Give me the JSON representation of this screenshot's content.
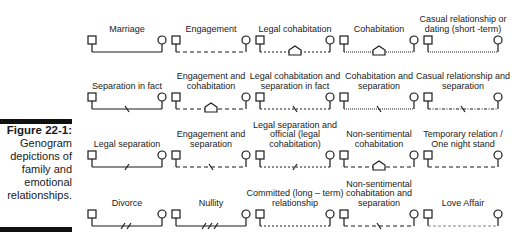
{
  "caption": {
    "title": "Figure 22-1:",
    "body": "Genogram depictions of family and emotional relationships."
  },
  "relationships": [
    {
      "label": "Marriage",
      "line": "solid",
      "marker": "none"
    },
    {
      "label": "Engagement",
      "line": "dashed",
      "marker": "none"
    },
    {
      "label": "Legal cohabitation",
      "line": "short-dashed",
      "marker": "house"
    },
    {
      "label": "Cohabitation",
      "line": "dotted",
      "marker": "house"
    },
    {
      "label": "Casual relationship or dating (short -term)",
      "line": "dotted",
      "marker": "none"
    },
    {
      "label": "Separation in fact",
      "line": "solid",
      "marker": "slash-1"
    },
    {
      "label": "Engagement and cohabitation",
      "line": "dashed",
      "marker": "house"
    },
    {
      "label": "Legal cohabitation and separation in fact",
      "line": "short-dashed",
      "marker": "slash-1"
    },
    {
      "label": "Cohabitation and separation",
      "line": "dotted",
      "marker": "slash-1"
    },
    {
      "label": "Casual relationship and separation",
      "line": "dash-dot",
      "marker": "slash-1"
    },
    {
      "label": "Legal separation",
      "line": "solid",
      "marker": "fwd-slash-1"
    },
    {
      "label": "Engagement and separation",
      "line": "dashed",
      "marker": "slash-1"
    },
    {
      "label": "Legal separation and official (legal cohabitation)",
      "line": "short-dashed",
      "marker": "fwd-slash-1"
    },
    {
      "label": "Non-sentimental cohabitation",
      "line": "dashed",
      "marker": "house"
    },
    {
      "label": "Temporary relation / One night stand",
      "line": "dashed",
      "marker": "none"
    },
    {
      "label": "Divorce",
      "line": "solid",
      "marker": "fwd-slash-2"
    },
    {
      "label": "Nullity",
      "line": "solid",
      "marker": "fwd-slash-3"
    },
    {
      "label": "Committed (long – term) relationship",
      "line": "short-dashed",
      "marker": "none"
    },
    {
      "label": "Non-sentimental cohabitation and separation",
      "line": "dashed",
      "marker": "slash-1"
    },
    {
      "label": "Love Affair",
      "line": "light-dashed",
      "marker": "none"
    }
  ],
  "legend_symbols": {
    "male": "square",
    "female": "circle"
  },
  "colors": {
    "ink": "#1a1a1a",
    "bar": "#111111",
    "background": "#ffffff"
  }
}
